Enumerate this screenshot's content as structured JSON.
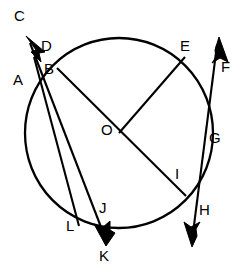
{
  "figure": {
    "type": "geometry-diagram",
    "width": 243,
    "height": 277,
    "stroke_color": "#000000",
    "background_color": "#ffffff"
  },
  "labels": {
    "A": "A",
    "B": "B",
    "C": "C",
    "D": "D",
    "E": "E",
    "F": "F",
    "G": "G",
    "H": "H",
    "I": "I",
    "J": "J",
    "K": "K",
    "L": "L",
    "O": "O"
  },
  "label_positions": {
    "A": {
      "x": 14,
      "y": 79
    },
    "B": {
      "x": 43,
      "y": 67
    },
    "C": {
      "x": 14,
      "y": 15
    },
    "D": {
      "x": 41,
      "y": 45
    },
    "E": {
      "x": 180,
      "y": 44
    },
    "F": {
      "x": 221,
      "y": 66
    },
    "G": {
      "x": 209,
      "y": 136
    },
    "H": {
      "x": 199,
      "y": 208
    },
    "I": {
      "x": 174,
      "y": 172
    },
    "J": {
      "x": 98,
      "y": 207
    },
    "K": {
      "x": 99,
      "y": 253
    },
    "L": {
      "x": 66,
      "y": 224
    },
    "O": {
      "x": 101,
      "y": 128
    }
  },
  "circle": {
    "center": {
      "x": 119,
      "y": 133
    },
    "radius_x": 94,
    "radius_y": 95
  },
  "segments": [
    {
      "name": "diameter-B-to-I",
      "from": "B",
      "to": "I",
      "x1": 57,
      "y1": 68,
      "x2": 186,
      "y2": 196
    },
    {
      "name": "radius-O-to-E",
      "from": "O",
      "to": "E",
      "x1": 119,
      "y1": 133,
      "x2": 185,
      "y2": 57
    },
    {
      "name": "secant-C-to-K",
      "from": "C",
      "to": "K",
      "x1": 27,
      "y1": 37,
      "x2": 106,
      "y2": 243
    },
    {
      "name": "secant-A-to-L",
      "from": "A",
      "to": "L",
      "x1": 36,
      "y1": 62,
      "x2": 78,
      "y2": 224
    },
    {
      "name": "line-F-to-H",
      "from": "F",
      "to": "H",
      "x1": 218,
      "y1": 40,
      "x2": 192,
      "y2": 244
    }
  ],
  "arrows": [
    {
      "name": "arrow-to-C",
      "tip": {
        "x": 27,
        "y": 37
      },
      "direction": "up-left"
    },
    {
      "name": "arrow-to-K",
      "tip": {
        "x": 106,
        "y": 245
      },
      "direction": "down"
    },
    {
      "name": "arrow-to-F",
      "tip": {
        "x": 219,
        "y": 38
      },
      "direction": "up"
    },
    {
      "name": "arrow-to-H",
      "tip": {
        "x": 192,
        "y": 246
      },
      "direction": "down"
    }
  ],
  "points_on_circle": [
    "B",
    "D",
    "E",
    "G",
    "I",
    "J",
    "L"
  ],
  "center_point": "O"
}
